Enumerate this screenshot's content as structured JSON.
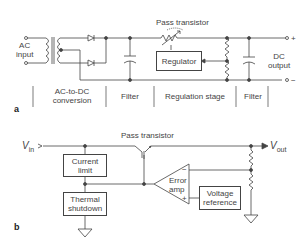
{
  "panel_a": {
    "label": "a",
    "ac_input": "AC input",
    "ac_input_l1": "AC",
    "ac_input_l2": "input",
    "pass_transistor": "Pass transistor",
    "regulator": "Regulator",
    "dc_output_l1": "DC",
    "dc_output_l2": "output",
    "plus": "+",
    "minus": "−",
    "stages": [
      {
        "l1": "AC-to-DC",
        "l2": "conversion"
      },
      {
        "l1": "Filter"
      },
      {
        "l1": "Regulation stage"
      },
      {
        "l1": "Filter"
      }
    ]
  },
  "panel_b": {
    "label": "b",
    "vin": "V",
    "vin_sub": "in",
    "vout": "V",
    "vout_sub": "out",
    "pass_transistor": "Pass transistor",
    "current_limit_l1": "Current",
    "current_limit_l2": "limit",
    "thermal_l1": "Thermal",
    "thermal_l2": "shutdown",
    "error_amp_l1": "Error",
    "error_amp_l2": "amp",
    "amp_minus": "−",
    "amp_plus": "+",
    "vref_l1": "Voltage",
    "vref_l2": "reference"
  },
  "colors": {
    "line": "#444444",
    "text": "#444444"
  }
}
